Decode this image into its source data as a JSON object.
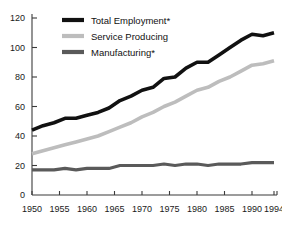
{
  "chart_data": {
    "type": "line",
    "title": "",
    "subtitle": "",
    "xlabel": "",
    "ylabel": "",
    "xlim": [
      1950,
      1994
    ],
    "ylim": [
      0,
      120
    ],
    "grid": false,
    "legend_position": "top-center",
    "y_ticks": [
      "0",
      "20",
      "40",
      "60",
      "80",
      "100",
      "120"
    ],
    "y_tick_values": [
      0,
      20,
      40,
      60,
      80,
      100,
      120
    ],
    "x_ticks": [
      "1950",
      "1955",
      "1960",
      "1965",
      "1970",
      "1975",
      "1980",
      "1985",
      "1990",
      "1994"
    ],
    "x_tick_values": [
      1950,
      1955,
      1960,
      1965,
      1970,
      1975,
      1980,
      1985,
      1990,
      1994
    ],
    "x": [
      1950,
      1952,
      1954,
      1956,
      1958,
      1960,
      1962,
      1964,
      1966,
      1968,
      1970,
      1972,
      1974,
      1976,
      1978,
      1980,
      1982,
      1984,
      1986,
      1988,
      1990,
      1992,
      1994
    ],
    "series": [
      {
        "name": "Total Employment*",
        "color": "#111111",
        "width": 3.6,
        "values": [
          44,
          47,
          49,
          52,
          52,
          54,
          56,
          59,
          64,
          67,
          71,
          73,
          79,
          80,
          86,
          90,
          90,
          95,
          100,
          105,
          109,
          108,
          110
        ]
      },
      {
        "name": "Service Producing",
        "color": "#bdbdbd",
        "width": 3.6,
        "values": [
          28,
          30,
          32,
          34,
          36,
          38,
          40,
          43,
          46,
          49,
          53,
          56,
          60,
          63,
          67,
          71,
          73,
          77,
          80,
          84,
          88,
          89,
          91
        ]
      },
      {
        "name": "Manufacturing*",
        "color": "#5a5a5a",
        "width": 3.2,
        "values": [
          17,
          17,
          17,
          18,
          17,
          18,
          18,
          18,
          20,
          20,
          20,
          20,
          21,
          20,
          21,
          21,
          20,
          21,
          21,
          21,
          22,
          22,
          22
        ]
      }
    ],
    "legend": [
      {
        "label": "Total Employment*",
        "color": "#111111"
      },
      {
        "label": "Service Producing",
        "color": "#bdbdbd"
      },
      {
        "label": "Manufacturing*",
        "color": "#5a5a5a"
      }
    ]
  }
}
